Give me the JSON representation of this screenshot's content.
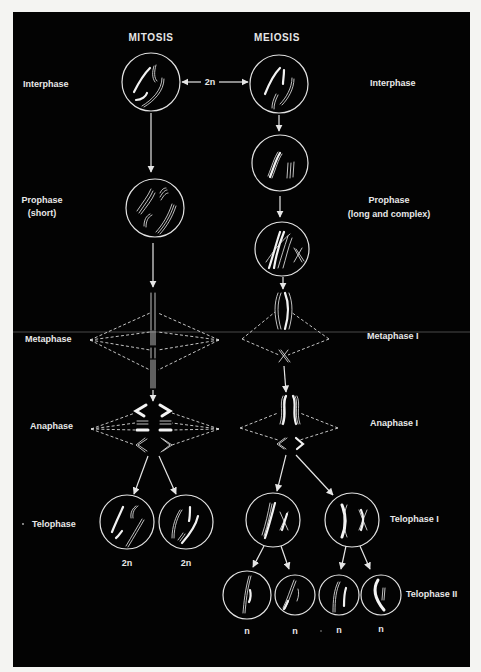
{
  "figure": {
    "column_titles": {
      "mitosis": "MITOSIS",
      "meiosis": "MEIOSIS"
    },
    "ploidy_connector": "2n",
    "mitosis_stage_labels": {
      "interphase": "Interphase",
      "prophase": "Prophase",
      "prophase_note": "(short)",
      "metaphase": "Metaphase",
      "anaphase": "Anaphase",
      "telophase": "Telophase"
    },
    "meiosis_stage_labels": {
      "interphase": "Interphase",
      "prophase": "Prophase",
      "prophase_note": "(long and complex)",
      "metaphase_1": "Metaphase I",
      "anaphase_1": "Anaphase I",
      "telophase_1": "Telophase I",
      "telophase_2": "Telophase II"
    },
    "mitosis_daughter_ploidy": [
      "2n",
      "2n"
    ],
    "meiosis_daughter_ploidy": [
      "n",
      "n",
      "n",
      "n"
    ],
    "colors": {
      "background": "#030303",
      "foreground": "#e8e8e8",
      "page": "#f4f4f2"
    }
  }
}
